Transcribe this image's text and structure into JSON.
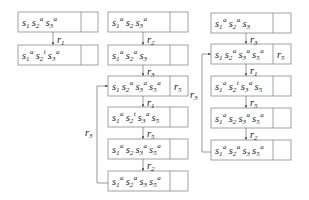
{
  "diagram": {
    "type": "state-transition-chains",
    "columns": [
      {
        "id": "col1",
        "boxes": [
          {
            "terms": [
              {
                "b": "s",
                "sub": "1",
                "sup": ""
              },
              {
                "b": "s",
                "sub": "2",
                "sup": "a"
              },
              {
                "b": "s",
                "sub": "3",
                "sup": "a"
              }
            ],
            "tag": ""
          },
          {
            "terms": [
              {
                "b": "s",
                "sub": "1",
                "sup": "a"
              },
              {
                "b": "s",
                "sub": "2",
                "sup": "t"
              },
              {
                "b": "s",
                "sub": "3",
                "sup": "a"
              }
            ],
            "tag": ""
          }
        ],
        "arrows": [
          "r1"
        ]
      },
      {
        "id": "col2",
        "boxes": [
          {
            "terms": [
              {
                "b": "s",
                "sub": "1",
                "sup": "a"
              },
              {
                "b": "s",
                "sub": "2",
                "sup": ""
              },
              {
                "b": "s",
                "sub": "3",
                "sup": "a"
              }
            ],
            "tag": ""
          },
          {
            "terms": [
              {
                "b": "s",
                "sub": "1",
                "sup": "a"
              },
              {
                "b": "s",
                "sub": "2",
                "sup": "a"
              },
              {
                "b": "s",
                "sub": "3",
                "sup": ""
              }
            ],
            "tag": ""
          },
          {
            "terms": [
              {
                "b": "s",
                "sub": "1",
                "sup": ""
              },
              {
                "b": "s",
                "sub": "2",
                "sup": "a"
              },
              {
                "b": "s",
                "sub": "3",
                "sup": "a"
              },
              {
                "b": "s",
                "sub": "5",
                "sup": "a"
              }
            ],
            "tag": "r5"
          },
          {
            "terms": [
              {
                "b": "s",
                "sub": "1",
                "sup": "a"
              },
              {
                "b": "s",
                "sub": "2",
                "sup": "t"
              },
              {
                "b": "s",
                "sub": "3",
                "sup": "a"
              },
              {
                "b": "s",
                "sub": "5",
                "sup": ""
              }
            ],
            "tag": ""
          },
          {
            "terms": [
              {
                "b": "s",
                "sub": "1",
                "sup": "a"
              },
              {
                "b": "s",
                "sub": "2",
                "sup": ""
              },
              {
                "b": "s",
                "sub": "3",
                "sup": "a"
              },
              {
                "b": "s",
                "sub": "5",
                "sup": "a"
              }
            ],
            "tag": ""
          },
          {
            "terms": [
              {
                "b": "s",
                "sub": "1",
                "sup": "a"
              },
              {
                "b": "s",
                "sub": "2",
                "sup": "a"
              },
              {
                "b": "s",
                "sub": "3",
                "sup": ""
              },
              {
                "b": "s",
                "sub": "5",
                "sup": "a"
              }
            ],
            "tag": ""
          }
        ],
        "arrows": [
          "r2",
          "r3",
          "r1",
          "r5",
          "r2"
        ],
        "loop_label": "r3"
      },
      {
        "id": "col3",
        "boxes": [
          {
            "terms": [
              {
                "b": "s",
                "sub": "1",
                "sup": "a"
              },
              {
                "b": "s",
                "sub": "2",
                "sup": "a"
              },
              {
                "b": "s",
                "sub": "3",
                "sup": ""
              }
            ],
            "tag": ""
          },
          {
            "terms": [
              {
                "b": "s",
                "sub": "1",
                "sup": ""
              },
              {
                "b": "s",
                "sub": "2",
                "sup": "a"
              },
              {
                "b": "s",
                "sub": "3",
                "sup": "a"
              },
              {
                "b": "s",
                "sub": "5",
                "sup": "a"
              }
            ],
            "tag": "r5"
          },
          {
            "terms": [
              {
                "b": "s",
                "sub": "1",
                "sup": "a"
              },
              {
                "b": "s",
                "sub": "2",
                "sup": "t"
              },
              {
                "b": "s",
                "sub": "3",
                "sup": "a"
              },
              {
                "b": "s",
                "sub": "5",
                "sup": ""
              }
            ],
            "tag": ""
          },
          {
            "terms": [
              {
                "b": "s",
                "sub": "1",
                "sup": "a"
              },
              {
                "b": "s",
                "sub": "2",
                "sup": ""
              },
              {
                "b": "s",
                "sub": "3",
                "sup": "a"
              },
              {
                "b": "s",
                "sub": "5",
                "sup": "a"
              }
            ],
            "tag": ""
          },
          {
            "terms": [
              {
                "b": "s",
                "sub": "1",
                "sup": "a"
              },
              {
                "b": "s",
                "sub": "2",
                "sup": "a"
              },
              {
                "b": "s",
                "sub": "3",
                "sup": ""
              },
              {
                "b": "s",
                "sub": "5",
                "sup": "a"
              }
            ],
            "tag": ""
          }
        ],
        "arrows": [
          "r3",
          "r1",
          "r5",
          "r2"
        ],
        "loop_label": "r3"
      }
    ]
  }
}
